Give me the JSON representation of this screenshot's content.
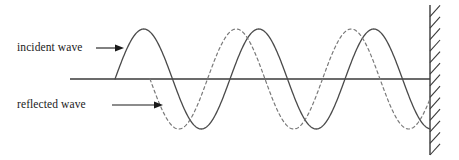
{
  "figure": {
    "type": "physics-wave-diagram",
    "width": 459,
    "height": 160,
    "background_color": "#ffffff",
    "stroke_color": "#3a3a3a",
    "text_color": "#1a1a1a"
  },
  "labels": {
    "incident": "incident wave",
    "reflected": "reflected wave"
  },
  "axis": {
    "y": 79,
    "x_start": 70,
    "x_end": 430,
    "stroke_width": 1.4
  },
  "wall": {
    "x": 430,
    "y_top": 5,
    "y_bottom": 155,
    "hatch_count": 13,
    "hatch_length": 15,
    "hatch_angle_deg": 48,
    "stroke_width": 1.4
  },
  "arrows": {
    "incident": {
      "x1": 96,
      "y1": 48,
      "x2": 124,
      "y2": 48,
      "head": 4.5
    },
    "reflected": {
      "x1": 112,
      "y1": 105,
      "x2": 163,
      "y2": 105,
      "head": 4.5
    }
  },
  "waves": {
    "incident": {
      "name": "incident wave",
      "style": "solid",
      "stroke": "#4a4a4a",
      "stroke_width": 1.3,
      "x_start": 115,
      "x_end": 430,
      "amplitude": 50,
      "wavelength": 115,
      "phase": "starts rising from axis at x=115",
      "peaks_x": [
        147,
        262,
        377
      ],
      "troughs_x": [
        205,
        320
      ],
      "zero_crossings_x": [
        115,
        176,
        234,
        291,
        349,
        406
      ]
    },
    "reflected": {
      "name": "reflected wave",
      "style": "dashed",
      "stroke": "#7a7a7a",
      "stroke_width": 1.2,
      "dash_pattern": "3,3",
      "x_start": 150,
      "x_end": 430,
      "amplitude": 50,
      "wavelength": 115,
      "phase": "inverted relative to incident; half-wavelength offset",
      "peaks_x": [
        207,
        322
      ],
      "troughs_x": [
        150,
        264,
        379
      ],
      "zero_crossings_x": [
        178,
        236,
        293,
        351,
        408
      ]
    }
  },
  "chart_data": {
    "type": "line",
    "title": "",
    "xlabel": "",
    "ylabel": "",
    "xlim": [
      70,
      430
    ],
    "ylim": [
      -50,
      50
    ],
    "grid": false,
    "legend": "inline-labels",
    "annotations": [
      "incident wave",
      "reflected wave"
    ],
    "series": [
      {
        "name": "incident wave",
        "style": "solid",
        "amplitude": 50,
        "wavelength": 115,
        "x_range": [
          115,
          430
        ]
      },
      {
        "name": "reflected wave",
        "style": "dashed",
        "amplitude": 50,
        "wavelength": 115,
        "x_range": [
          150,
          430
        ]
      }
    ]
  }
}
